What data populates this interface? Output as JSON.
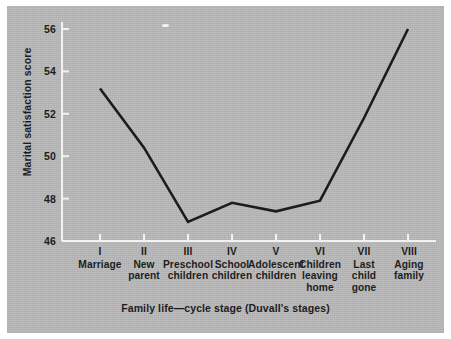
{
  "chart_data": {
    "type": "line",
    "title": "",
    "subtitle": "",
    "xlabel": "Family life—cycle stage (Duvall's stages)",
    "ylabel": "Marital satisfaction score",
    "categories": [
      "I",
      "II",
      "III",
      "IV",
      "V",
      "VI",
      "VII",
      "VIII"
    ],
    "category_descriptions": [
      [
        "Marriage"
      ],
      [
        "New",
        "parent"
      ],
      [
        "Preschool",
        "children"
      ],
      [
        "School",
        "children"
      ],
      [
        "Adolescent",
        "children"
      ],
      [
        "Children",
        "leaving",
        "home"
      ],
      [
        "Last",
        "child",
        "gone"
      ],
      [
        "Aging",
        "family"
      ]
    ],
    "x": [
      1,
      2,
      3,
      4,
      5,
      6,
      7,
      8
    ],
    "values": [
      53.2,
      50.4,
      46.9,
      47.8,
      47.4,
      47.9,
      51.8,
      56.0
    ],
    "ylim": [
      46,
      56
    ],
    "yticks": [
      46,
      48,
      50,
      52,
      54,
      56
    ],
    "ytick_labels": [
      "46",
      "48",
      "50",
      "52",
      "54",
      "56"
    ],
    "xlim": [
      0.5,
      8.5
    ],
    "grid": false,
    "legend": null,
    "legend_position": "none",
    "line_color": "#1c1c1c",
    "background_color": "#b9b9b9",
    "axis_color": "#f2f2f2",
    "text_color": "#1d1d1d",
    "annotations": []
  }
}
